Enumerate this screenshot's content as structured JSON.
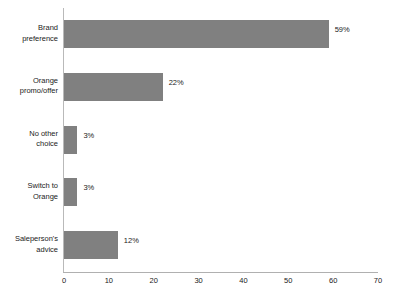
{
  "chart_data": {
    "type": "bar",
    "orientation": "horizontal",
    "title": "",
    "subtitle": "",
    "xlabel": "",
    "ylabel": "",
    "categories": [
      "Brand\npreference",
      "Orange\npromo/offer",
      "No other\nchoice",
      "Switch to\nOrange",
      "Saleperson's\nadvice"
    ],
    "values": [
      59,
      22,
      3,
      3,
      12
    ],
    "data_labels": [
      "59%",
      "22%",
      "3%",
      "3%",
      "12%"
    ],
    "xlim": [
      0,
      70
    ],
    "xticks": [
      0,
      10,
      20,
      30,
      40,
      50,
      60,
      70
    ],
    "xtick_labels": [
      "0",
      "10",
      "20",
      "30",
      "40",
      "50",
      "60",
      "70"
    ],
    "grid": false,
    "legend": false,
    "bar_color": "#808080",
    "axis_color": "#b0b0b0",
    "text_color": "#1a1a1a",
    "background": "#ffffff"
  }
}
